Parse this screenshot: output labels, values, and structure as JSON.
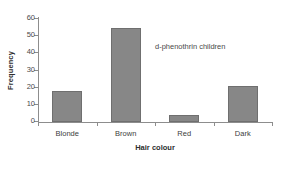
{
  "chart_data": {
    "type": "bar",
    "title": "",
    "subtitle": "",
    "categories": [
      "Blonde",
      "Brown",
      "Red",
      "Dark"
    ],
    "values": [
      18,
      55,
      4,
      21
    ],
    "xlabel": "Hair colour",
    "ylabel": "Frequency",
    "ylim": [
      0,
      60
    ],
    "yticks": [
      0,
      10,
      20,
      30,
      40,
      50,
      60
    ],
    "ytick_labels": [
      "0",
      "10",
      "20",
      "30",
      "40",
      "50",
      "60"
    ],
    "grid": false,
    "legend": false,
    "annotations": [
      {
        "text": "d-phenothrin children",
        "x": 0.5,
        "y": 44
      }
    ],
    "colors": {
      "bar_fill": "#878787",
      "bar_edge": "#6f6f6f",
      "axis": "#8d8d8d",
      "text": "#3d3d3d",
      "background": "#ffffff"
    }
  }
}
